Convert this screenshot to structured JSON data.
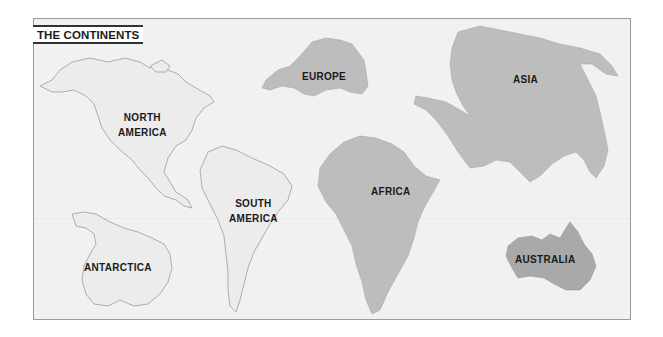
{
  "map": {
    "title": "THE CONTINENTS",
    "colors": {
      "background": "#f1f1f1",
      "frame_border": "#9a9a9a",
      "light_land": "#ebebeb",
      "light_outline": "#9a9a9a",
      "medium_land": "#bdbdbd",
      "dark_land": "#a9a9a9"
    },
    "continents": [
      {
        "name": "North America",
        "label_line1": "NORTH",
        "label_line2": "AMERICA",
        "fill": "light"
      },
      {
        "name": "South America",
        "label_line1": "SOUTH",
        "label_line2": "AMERICA",
        "fill": "light"
      },
      {
        "name": "Europe",
        "label_line1": "EUROPE",
        "fill": "medium"
      },
      {
        "name": "Asia",
        "label_line1": "ASIA",
        "fill": "medium"
      },
      {
        "name": "Africa",
        "label_line1": "AFRICA",
        "fill": "medium"
      },
      {
        "name": "Antarctica",
        "label_line1": "ANTARCTICA",
        "fill": "light"
      },
      {
        "name": "Australia",
        "label_line1": "AUSTRALIA",
        "fill": "dark"
      }
    ]
  }
}
